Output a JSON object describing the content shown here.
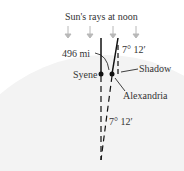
{
  "diagram": {
    "title": "Sun's rays at noon",
    "distance_label": "496 mi",
    "angle_top": "7° 12′",
    "angle_bottom": "7° 12′",
    "city_left": "Syene",
    "city_right": "Alexandria",
    "shadow_label": "Shadow",
    "colors": {
      "arrow": "#b8b8b8",
      "line": "#111111",
      "globe": "#f0f0f0"
    }
  }
}
